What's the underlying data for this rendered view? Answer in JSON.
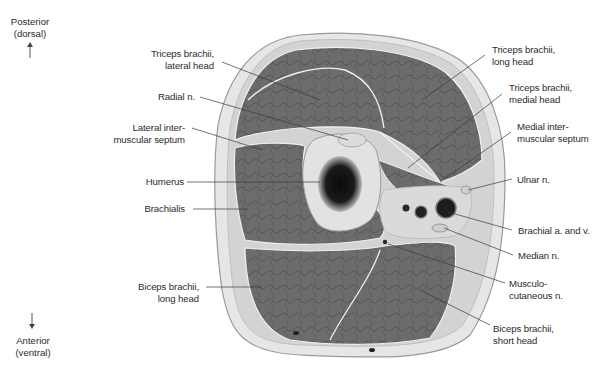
{
  "orientation": {
    "top": {
      "line1": "Posterior",
      "line2": "(dorsal)",
      "arrow": "arrow-up"
    },
    "bottom": {
      "line1": "Anterior",
      "line2": "(ventral)",
      "arrow": "arrow-down"
    }
  },
  "labels_left": [
    {
      "id": "triceps-lateral-head",
      "line1": "Triceps brachii,",
      "line2": "lateral head"
    },
    {
      "id": "radial-nerve",
      "line1": "Radial n.",
      "line2": ""
    },
    {
      "id": "lateral-intermuscular-septum",
      "line1": "Lateral inter-",
      "line2": "muscular septum"
    },
    {
      "id": "humerus",
      "line1": "Humerus",
      "line2": ""
    },
    {
      "id": "brachialis",
      "line1": "Brachialis",
      "line2": ""
    },
    {
      "id": "biceps-long-head",
      "line1": "Biceps brachii,",
      "line2": "long head"
    }
  ],
  "labels_right": [
    {
      "id": "triceps-long-head",
      "line1": "Triceps brachii,",
      "line2": "long head"
    },
    {
      "id": "triceps-medial-head",
      "line1": "Triceps brachii,",
      "line2": "medial head"
    },
    {
      "id": "medial-intermuscular-septum",
      "line1": "Medial inter-",
      "line2": "muscular septum"
    },
    {
      "id": "ulnar-nerve",
      "line1": "Ulnar n.",
      "line2": ""
    },
    {
      "id": "brachial-artery-vein",
      "line1": "Brachial a. and v.",
      "line2": ""
    },
    {
      "id": "median-nerve",
      "line1": "Median n.",
      "line2": ""
    },
    {
      "id": "musculocutaneous-nerve",
      "line1": "Musculo-",
      "line2": "cutaneous n."
    },
    {
      "id": "biceps-short-head",
      "line1": "Biceps brachii,",
      "line2": "short head"
    }
  ],
  "colors": {
    "muscle": "#6e6e6e",
    "muscle_dark": "#4a4a4a",
    "fat": "#d6d6d6",
    "skin": "#e8e8e8",
    "bone_cortex": "#e4e4e4",
    "marrow": "#141414",
    "leader": "#3a3a3a"
  }
}
